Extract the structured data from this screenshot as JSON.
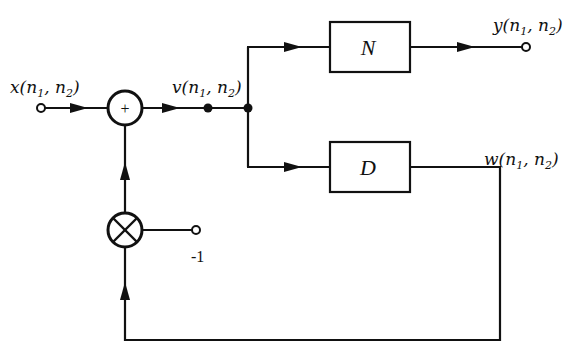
{
  "diagram": {
    "type": "block-diagram",
    "signals": {
      "input": {
        "name": "x",
        "args": [
          "n",
          "1",
          "n",
          "2"
        ],
        "label": "x(n1, n2)"
      },
      "intermediate": {
        "name": "v",
        "label": "v(n1, n2)"
      },
      "output": {
        "name": "y",
        "label": "y(n1, n2)"
      },
      "feedback": {
        "name": "w",
        "label": "w(n1, n2)"
      }
    },
    "blocks": {
      "top": {
        "label": "N"
      },
      "bottom": {
        "label": "D"
      }
    },
    "adder": {
      "symbol": "+"
    },
    "multiplier": {
      "symbol": "⊗",
      "gain_label": "-1"
    },
    "labels": {
      "x": "x",
      "v": "v",
      "y": "y",
      "w": "w",
      "n": "n",
      "sub1": "1",
      "sub2": "2",
      "open": "(",
      "comma": ", ",
      "close": ")",
      "plus": "+",
      "minus_one": "-1"
    },
    "colors": {
      "stroke": "#111111",
      "background": "#ffffff"
    }
  }
}
